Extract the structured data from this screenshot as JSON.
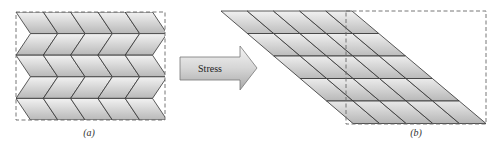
{
  "figure": {
    "panel_a": {
      "label": "(a)",
      "rows": 5,
      "columns": 5,
      "description": "unstressed chevron grid"
    },
    "arrow": {
      "label": "Stress"
    },
    "panel_b": {
      "label": "(b)",
      "rows": 5,
      "columns": 5,
      "description": "sheared parallelogram grid"
    },
    "colors": {
      "cell_light": "#efefef",
      "cell_dark": "#b9b9b9",
      "line": "#333333",
      "dash": "#666666"
    }
  }
}
